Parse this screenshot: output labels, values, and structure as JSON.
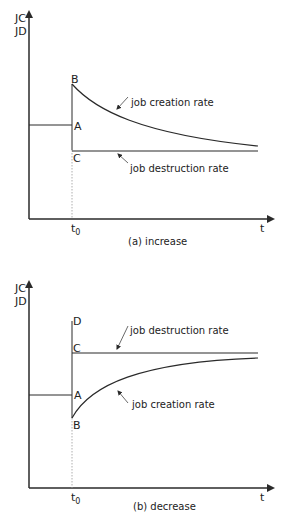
{
  "panels": [
    {
      "id": "a",
      "caption": "(a) increase",
      "y_axis_label_top": "JC",
      "y_axis_label_bottom": "JD",
      "x_axis_label": "t",
      "time_marker": "t",
      "time_marker_sub": "0",
      "points": {
        "B": "B",
        "A": "A",
        "C": "C"
      },
      "curve_labels": {
        "creation": "job creation rate",
        "destruction": "job destruction rate"
      }
    },
    {
      "id": "b",
      "caption": "(b) decrease",
      "y_axis_label_top": "JC",
      "y_axis_label_bottom": "JD",
      "x_axis_label": "t",
      "time_marker": "t",
      "time_marker_sub": "0",
      "points": {
        "D": "D",
        "C": "C",
        "A": "A",
        "B": "B"
      },
      "curve_labels": {
        "destruction": "job destruction rate",
        "creation": "job creation rate"
      }
    }
  ],
  "colors": {
    "line": "#2a2a2a",
    "dotted": "#9a9a9a"
  }
}
